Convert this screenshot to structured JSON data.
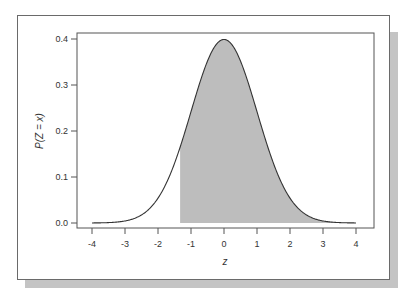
{
  "chart_data": {
    "type": "area",
    "title": "",
    "xlabel": "z",
    "ylabel": "P(Z = x)",
    "xlim": [
      -4,
      4
    ],
    "ylim": [
      0,
      0.4
    ],
    "xticks": [
      -4,
      -3,
      -2,
      -1,
      0,
      1,
      2,
      3,
      4
    ],
    "xtick_labels": [
      "-4",
      "-3",
      "-2",
      "-1",
      "0",
      "1",
      "2",
      "3",
      "4"
    ],
    "yticks": [
      0.0,
      0.1,
      0.2,
      0.3,
      0.4
    ],
    "ytick_labels": [
      "0.0",
      "0.1",
      "0.2",
      "0.3",
      "0.4"
    ],
    "grid": false,
    "legend": null,
    "series": [
      {
        "name": "Standard normal density",
        "function": "normal_pdf(mean=0, sd=1)",
        "x": [
          -4,
          -3.5,
          -3,
          -2.5,
          -2,
          -1.5,
          -1,
          -0.5,
          0,
          0.5,
          1,
          1.5,
          2,
          2.5,
          3,
          3.5,
          4
        ],
        "values": [
          0.0001,
          0.0009,
          0.0044,
          0.0175,
          0.054,
          0.1295,
          0.242,
          0.3521,
          0.3989,
          0.3521,
          0.242,
          0.1295,
          0.054,
          0.0175,
          0.0044,
          0.0009,
          0.0001
        ]
      }
    ],
    "shaded_region": {
      "from": -1.33,
      "to": 4,
      "color": "#bdbdbd"
    },
    "colors": {
      "line": "#333333",
      "fill": "#bdbdbd",
      "axis": "#555555",
      "shadow": "#c4c4c4"
    }
  }
}
